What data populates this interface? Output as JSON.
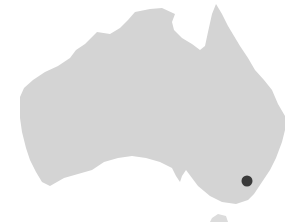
{
  "map": {
    "region": "Australia",
    "land_color": "#d4d4d4",
    "background_color": "#ffffff",
    "markers": [
      {
        "x": 247,
        "y": 181,
        "radius": 5.5,
        "color": "#3a3a3a"
      }
    ]
  }
}
